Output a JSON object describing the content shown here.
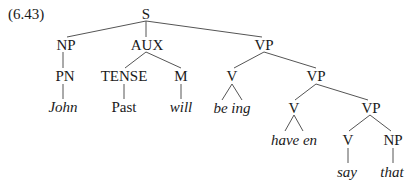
{
  "example_number": "(6.43)",
  "nodes": {
    "S": "S",
    "NP1": "NP",
    "AUX": "AUX",
    "VP1": "VP",
    "PN": "PN",
    "TENSE": "TENSE",
    "M": "M",
    "V1": "V",
    "VP2": "VP",
    "John": "John",
    "Past": "Past",
    "will": "will",
    "be_ing": "be ing",
    "V2": "V",
    "VP3": "VP",
    "have_en": "have en",
    "V3": "V",
    "NP2": "NP",
    "say": "say",
    "that": "that"
  },
  "colors": {
    "line": "#555555",
    "text": "#1a1a1a"
  }
}
